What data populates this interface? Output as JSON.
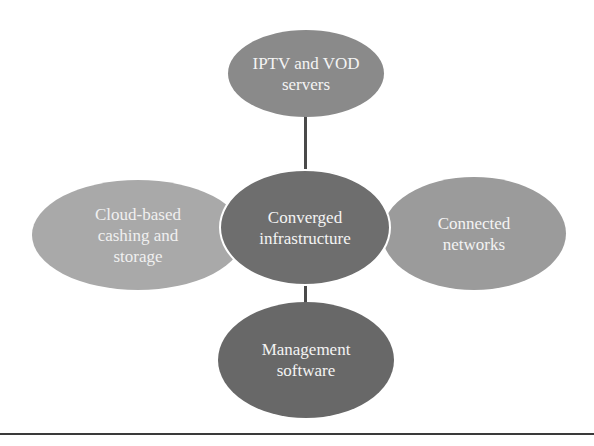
{
  "diagram": {
    "type": "hub-and-spoke",
    "hub": {
      "label": "Converged infrastructure",
      "lines": [
        "Converged",
        "infrastructure"
      ],
      "color": "#6e6e6e"
    },
    "nodes": {
      "top": {
        "label": "IPTV and VOD servers",
        "lines": [
          "IPTV and VOD",
          "servers"
        ],
        "color": "#8a8a8a"
      },
      "left": {
        "label": "Cloud-based cashing and storage",
        "lines": [
          "Cloud-based",
          "cashing and",
          "storage"
        ],
        "color": "#a9a9a9"
      },
      "right": {
        "label": "Connected networks",
        "lines": [
          "Connected",
          "networks"
        ],
        "color": "#9b9b9b"
      },
      "bottom": {
        "label": "Management software",
        "lines": [
          "Management",
          "software"
        ],
        "color": "#686868"
      }
    },
    "edges": [
      {
        "from": "hub",
        "to": "top"
      },
      {
        "from": "hub",
        "to": "bottom"
      },
      {
        "from": "hub",
        "to": "left"
      },
      {
        "from": "hub",
        "to": "right"
      }
    ]
  }
}
